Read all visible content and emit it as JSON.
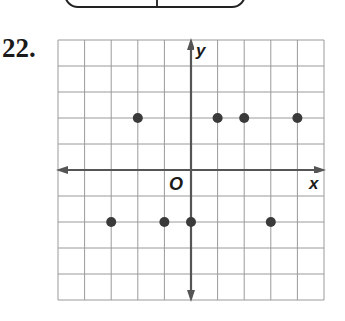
{
  "problem_number": "22.",
  "chart_data": {
    "type": "scatter",
    "title": "",
    "xlabel": "x",
    "ylabel": "y",
    "origin_label": "O",
    "xlim": [
      -5,
      5
    ],
    "ylim": [
      -5,
      5
    ],
    "grid": true,
    "grid_step": 1,
    "legend": null,
    "points": [
      {
        "x": -2,
        "y": 2
      },
      {
        "x": 1,
        "y": 2
      },
      {
        "x": 2,
        "y": 2
      },
      {
        "x": 4,
        "y": 2
      },
      {
        "x": -3,
        "y": -2
      },
      {
        "x": -1,
        "y": -2
      },
      {
        "x": 0,
        "y": -2
      },
      {
        "x": 3,
        "y": -2
      }
    ],
    "colors": {
      "point": "#3a3a3a",
      "axis": "#555555",
      "grid": "#9a9a9a"
    }
  }
}
